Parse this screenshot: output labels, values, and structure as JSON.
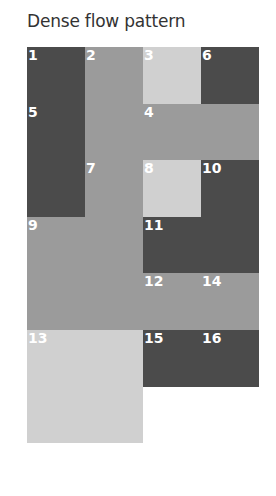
{
  "title": "Dense flow pattern",
  "grid": {
    "columns": 4,
    "rows": 7,
    "colors": {
      "dark": "#4b4b4b",
      "medium": "#9b9b9b",
      "light": "#d0d0d0"
    },
    "items": [
      {
        "label": "1",
        "col": 1,
        "row": 1,
        "colspan": 1,
        "rowspan": 1,
        "shade": "dark"
      },
      {
        "label": "2",
        "col": 2,
        "row": 1,
        "colspan": 1,
        "rowspan": 2,
        "shade": "medium"
      },
      {
        "label": "3",
        "col": 3,
        "row": 1,
        "colspan": 1,
        "rowspan": 1,
        "shade": "light"
      },
      {
        "label": "6",
        "col": 4,
        "row": 1,
        "colspan": 1,
        "rowspan": 1,
        "shade": "dark"
      },
      {
        "label": "5",
        "col": 1,
        "row": 2,
        "colspan": 1,
        "rowspan": 2,
        "shade": "dark"
      },
      {
        "label": "4",
        "col": 3,
        "row": 2,
        "colspan": 2,
        "rowspan": 1,
        "shade": "medium"
      },
      {
        "label": "7",
        "col": 2,
        "row": 3,
        "colspan": 1,
        "rowspan": 1,
        "shade": "medium"
      },
      {
        "label": "8",
        "col": 3,
        "row": 3,
        "colspan": 1,
        "rowspan": 1,
        "shade": "light"
      },
      {
        "label": "10",
        "col": 4,
        "row": 3,
        "colspan": 1,
        "rowspan": 1,
        "shade": "dark"
      },
      {
        "label": "9",
        "col": 1,
        "row": 4,
        "colspan": 2,
        "rowspan": 2,
        "shade": "medium"
      },
      {
        "label": "11",
        "col": 3,
        "row": 4,
        "colspan": 2,
        "rowspan": 1,
        "shade": "dark"
      },
      {
        "label": "12",
        "col": 3,
        "row": 5,
        "colspan": 1,
        "rowspan": 1,
        "shade": "medium"
      },
      {
        "label": "14",
        "col": 4,
        "row": 5,
        "colspan": 1,
        "rowspan": 1,
        "shade": "medium"
      },
      {
        "label": "13",
        "col": 1,
        "row": 6,
        "colspan": 2,
        "rowspan": 2,
        "shade": "light"
      },
      {
        "label": "15",
        "col": 3,
        "row": 6,
        "colspan": 1,
        "rowspan": 1,
        "shade": "dark"
      },
      {
        "label": "16",
        "col": 4,
        "row": 6,
        "colspan": 1,
        "rowspan": 1,
        "shade": "dark"
      }
    ]
  }
}
